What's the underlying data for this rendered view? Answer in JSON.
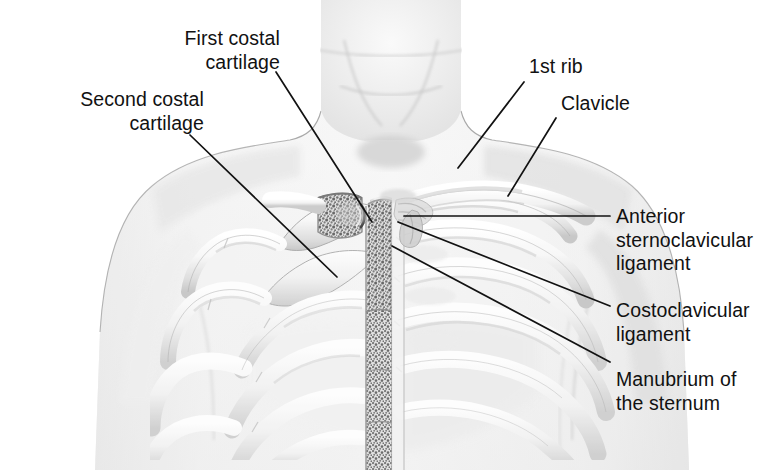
{
  "figure": {
    "view": "anterior",
    "rendering": "grayscale pencil / airbrush medical illustration",
    "background_color": "#ffffff",
    "skin_tone_color": "#f3f3f3",
    "bone_color": "#ededed",
    "bone_shadow_color": "#b9b9b9",
    "spongy_bone_color": "#6f6f6f",
    "leader_line_color": "#111111",
    "label_text_color": "#111111"
  },
  "labels": [
    {
      "id": "first-costal-cartilage",
      "text_lines": [
        "First costal",
        "cartilage"
      ],
      "align": "right",
      "leader": {
        "from": [
          276,
          72
        ],
        "to": [
          372,
          222
        ]
      }
    },
    {
      "id": "second-costal-cartilage",
      "text_lines": [
        "Second costal",
        "cartilage"
      ],
      "align": "right",
      "leader": {
        "from": [
          190,
          135
        ],
        "to": [
          337,
          277
        ]
      }
    },
    {
      "id": "first-rib",
      "text_lines": [
        "1st rib"
      ],
      "align": "left",
      "leader": {
        "from": [
          524,
          82
        ],
        "to": [
          458,
          168
        ]
      }
    },
    {
      "id": "clavicle",
      "text_lines": [
        "Clavicle"
      ],
      "align": "left",
      "leader": {
        "from": [
          556,
          118
        ],
        "to": [
          508,
          196
        ]
      }
    },
    {
      "id": "anterior-sternoclavicular-ligament",
      "text_lines": [
        "Anterior",
        "sternoclavicular",
        "ligament"
      ],
      "align": "left",
      "leader": {
        "from": [
          610,
          216
        ],
        "to": [
          404,
          216
        ]
      }
    },
    {
      "id": "costoclavicular-ligament",
      "text_lines": [
        "Costoclavicular",
        "ligament"
      ],
      "align": "left",
      "leader": {
        "from": [
          610,
          306
        ],
        "to": [
          398,
          222
        ]
      }
    },
    {
      "id": "manubrium-of-the-sternum",
      "text_lines": [
        "Manubrium of",
        "the sternum"
      ],
      "align": "left",
      "leader": {
        "from": [
          610,
          362
        ],
        "to": [
          392,
          246
        ]
      }
    }
  ],
  "label_text": {
    "first_costal": "First costal\ncartilage",
    "second_costal": "Second costal\ncartilage",
    "first_rib": "1st rib",
    "clavicle": "Clavicle",
    "anterior_sternoclavicular_ligament": "Anterior\nsternoclavicular\nligament",
    "costoclavicular_ligament": "Costoclavicular\nligament",
    "manubrium": "Manubrium of\nthe sternum"
  }
}
